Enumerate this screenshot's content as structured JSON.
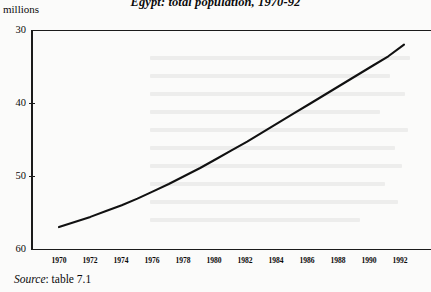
{
  "figure": {
    "title": "Egypt: total population, 1970-92",
    "y_axis_unit": "millions",
    "source_label": "Source",
    "source_separator": ":",
    "source_value": "table 7.1",
    "line_color": "#111111",
    "axis_color": "#1b1b1b",
    "background_color": "#fbfbfa"
  },
  "chart_data": {
    "type": "line",
    "title": "Egypt: total population, 1970-92",
    "xlabel": "",
    "ylabel": "millions",
    "xlim": [
      1969,
      1993.6
    ],
    "ylim": [
      30,
      60
    ],
    "grid": false,
    "legend": "none",
    "x_tick_labels": [
      "1970",
      "1972",
      "1974",
      "1976",
      "1978",
      "1980",
      "1982",
      "1984",
      "1986",
      "1988",
      "1990",
      "1992"
    ],
    "x_ticks": [
      1970,
      1972,
      1974,
      1976,
      1978,
      1980,
      1982,
      1984,
      1986,
      1988,
      1990,
      1992
    ],
    "y_tick_labels": [
      "30",
      "40",
      "50",
      "60"
    ],
    "y_ticks": [
      30,
      40,
      50,
      60
    ],
    "x": [
      1970,
      1971,
      1972,
      1973,
      1974,
      1975,
      1976,
      1977,
      1978,
      1979,
      1980,
      1981,
      1982,
      1983,
      1984,
      1985,
      1986,
      1987,
      1988,
      1989,
      1990,
      1991,
      1992
    ],
    "series": [
      {
        "name": "Total population",
        "values": [
          33.0,
          33.7,
          34.4,
          35.2,
          36.0,
          36.9,
          37.9,
          38.9,
          40.0,
          41.1,
          42.3,
          43.5,
          44.7,
          46.0,
          47.3,
          48.6,
          49.9,
          51.2,
          52.5,
          53.8,
          55.1,
          56.4,
          58.0
        ]
      }
    ]
  }
}
